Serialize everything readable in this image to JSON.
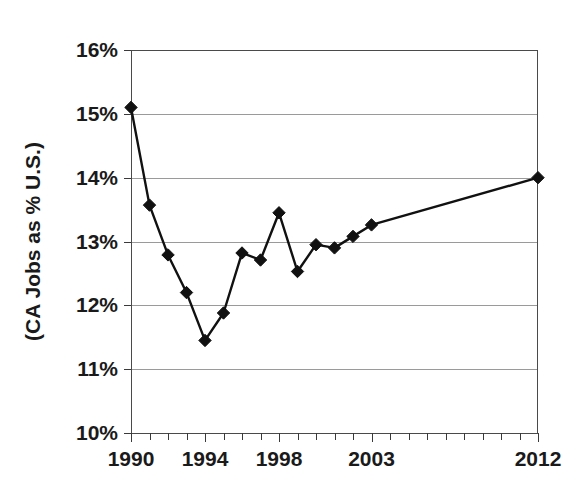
{
  "chart_data": {
    "type": "line",
    "title": "",
    "subtitle": "",
    "xlabel": "",
    "ylabel": "(CA Jobs as % U.S.)",
    "xlim": [
      1990,
      2012
    ],
    "ylim": [
      10,
      16
    ],
    "grid": true,
    "legend": null,
    "y_tick_labels": [
      "16%",
      "15%",
      "14%",
      "13%",
      "12%",
      "11%",
      "10%"
    ],
    "y_tick_values": [
      16,
      15,
      14,
      13,
      12,
      11,
      10
    ],
    "x_tick_labels": [
      "1990",
      "1994",
      "1998",
      "2003",
      "2012"
    ],
    "x_tick_values": [
      1990,
      1994,
      1998,
      2003,
      2012
    ],
    "x_minor_ticks": [
      1990,
      1991,
      1992,
      1993,
      1994,
      1995,
      1996,
      1997,
      1998,
      1999,
      2000,
      2001,
      2002,
      2003,
      2004,
      2005,
      2006,
      2007,
      2008,
      2009,
      2010,
      2011,
      2012
    ],
    "x": [
      1990,
      1991,
      1992,
      1993,
      1994,
      1995,
      1996,
      1997,
      1998,
      1999,
      2000,
      2001,
      2002,
      2003,
      2012
    ],
    "values": [
      15.1,
      13.57,
      12.79,
      12.2,
      11.45,
      11.88,
      12.82,
      12.71,
      13.45,
      12.53,
      12.95,
      12.9,
      13.08,
      13.26,
      14.0
    ],
    "series": [
      {
        "name": "CA Jobs as % U.S.",
        "marker": "diamond",
        "color": "#111111",
        "points": [
          {
            "x": 1990,
            "y": 15.1
          },
          {
            "x": 1991,
            "y": 13.57
          },
          {
            "x": 1992,
            "y": 12.79
          },
          {
            "x": 1993,
            "y": 12.2
          },
          {
            "x": 1994,
            "y": 11.45
          },
          {
            "x": 1995,
            "y": 11.88
          },
          {
            "x": 1996,
            "y": 12.82
          },
          {
            "x": 1997,
            "y": 12.71
          },
          {
            "x": 1998,
            "y": 13.45
          },
          {
            "x": 1999,
            "y": 12.53
          },
          {
            "x": 2000,
            "y": 12.95
          },
          {
            "x": 2001,
            "y": 12.9
          },
          {
            "x": 2002,
            "y": 13.08
          },
          {
            "x": 2003,
            "y": 13.26
          },
          {
            "x": 2012,
            "y": 14.0
          }
        ]
      }
    ],
    "colors": {
      "background": "#ffffff",
      "line": "#111111",
      "marker": "#111111",
      "grid": "#9a9a9a",
      "axis": "#4a4a4a",
      "text": "#1a1a1a"
    }
  }
}
